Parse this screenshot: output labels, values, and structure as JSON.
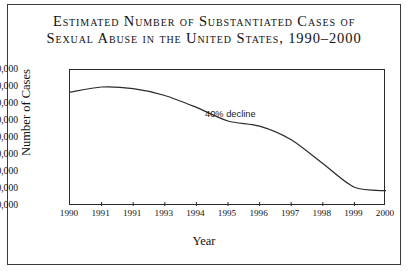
{
  "figure": {
    "title_lines": [
      "Estimated Number of Substantiated Cases of",
      "Sexual Abuse in the United States, 1990–2000"
    ]
  },
  "chart_data": {
    "type": "line",
    "title": "Estimated Number of Substantiated Cases of Sexual Abuse in the United States, 1990–2000",
    "xlabel": "Year",
    "ylabel": "Number of Cases",
    "x": [
      1990,
      1991,
      1992,
      1993,
      1994,
      1995,
      1996,
      1997,
      1998,
      1999,
      2000
    ],
    "xtick_labels": [
      "1990",
      "1991",
      "1991",
      "1993",
      "1994",
      "1995",
      "1996",
      "1997",
      "1998",
      "1999",
      "2000"
    ],
    "values": [
      147000,
      150000,
      149000,
      145000,
      138000,
      130000,
      127000,
      119000,
      105000,
      91000,
      89000
    ],
    "ytick_labels": [
      "160,000",
      "150,000",
      "140,000",
      "130,000",
      "120,000",
      "110,000",
      "100,000",
      "90,000",
      "80,000"
    ],
    "ytick_values": [
      160000,
      150000,
      140000,
      130000,
      120000,
      110000,
      100000,
      90000,
      80000
    ],
    "ylim": [
      80000,
      160000
    ],
    "xlim": [
      1990,
      2000
    ],
    "grid": false,
    "legend": false,
    "line_color": "#2b2b2b",
    "annotations": [
      {
        "text": "40% decline",
        "x": 1995,
        "y": 133000
      }
    ]
  }
}
